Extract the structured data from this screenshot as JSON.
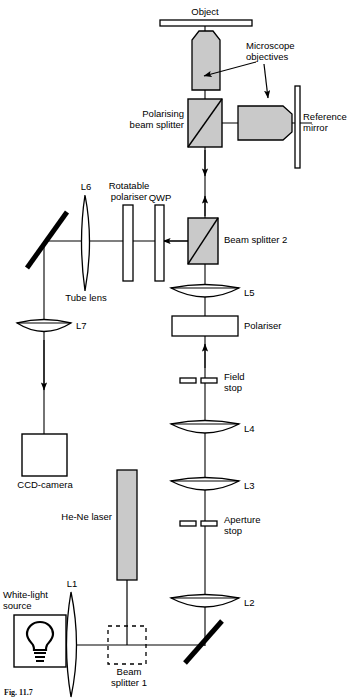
{
  "figure": {
    "caption": "Fig. 11.7"
  },
  "labels": {
    "object": "Object",
    "microscope_objectives": "Microscope\nobjectives",
    "polarising_beam_splitter": "Polarising\nbeam splitter",
    "reference_mirror": "Reference\nmirror",
    "rotatable_polariser": "Rotatable\npolariser",
    "qwp": "QWP",
    "l6": "L6",
    "tube_lens": "Tube lens",
    "beam_splitter_2": "Beam splitter 2",
    "l5": "L5",
    "polariser": "Polariser",
    "field_stop": "Field\nstop",
    "l4": "L4",
    "l7": "L7",
    "ccd_camera": "CCD-camera",
    "l3": "L3",
    "aperture_stop": "Aperture\nstop",
    "he_ne_laser": "He-Ne laser",
    "white_light_source": "White-light\nsource",
    "l1": "L1",
    "l2": "L2",
    "beam_splitter_1": "Beam\nsplitter 1"
  },
  "colors": {
    "stroke": "#000000",
    "component_fill": "#c9c9c9",
    "white_fill": "#ffffff",
    "background": "#ffffff"
  },
  "components": [
    {
      "name": "object",
      "type": "sample-bar",
      "label": "Object"
    },
    {
      "name": "objective-vertical",
      "type": "microscope-objective",
      "orientation": "down"
    },
    {
      "name": "objective-horizontal",
      "type": "microscope-objective",
      "orientation": "right"
    },
    {
      "name": "polarising-beam-splitter",
      "type": "cube-beamsplitter"
    },
    {
      "name": "reference-mirror",
      "type": "mirror-plate"
    },
    {
      "name": "beam-splitter-2",
      "type": "cube-beamsplitter"
    },
    {
      "name": "qwp",
      "type": "waveplate"
    },
    {
      "name": "rotatable-polariser",
      "type": "polariser-plate"
    },
    {
      "name": "l6-tube-lens",
      "type": "lens"
    },
    {
      "name": "fold-mirror-upper",
      "type": "fold-mirror"
    },
    {
      "name": "l7-lens",
      "type": "lens"
    },
    {
      "name": "ccd-camera",
      "type": "detector-box"
    },
    {
      "name": "l5-lens",
      "type": "lens"
    },
    {
      "name": "polariser",
      "type": "polariser-plate"
    },
    {
      "name": "field-stop",
      "type": "aperture-pair"
    },
    {
      "name": "l4-lens",
      "type": "lens"
    },
    {
      "name": "l3-lens",
      "type": "lens"
    },
    {
      "name": "aperture-stop",
      "type": "aperture-pair"
    },
    {
      "name": "l2-lens",
      "type": "lens"
    },
    {
      "name": "fold-mirror-lower",
      "type": "fold-mirror"
    },
    {
      "name": "he-ne-laser",
      "type": "laser-source"
    },
    {
      "name": "white-light-source",
      "type": "lamp-box"
    },
    {
      "name": "l1-lens",
      "type": "lens"
    },
    {
      "name": "beam-splitter-1",
      "type": "dashed-beamsplitter"
    }
  ]
}
